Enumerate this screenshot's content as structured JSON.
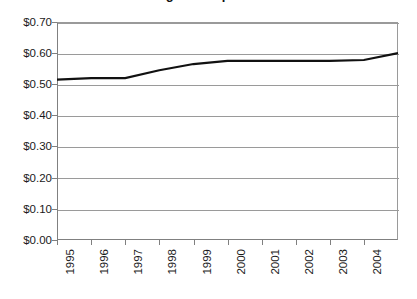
{
  "chart": {
    "title": "Average Price per Gallon",
    "title_note": "title is cropped off the top edge of the screenshot"
  },
  "axes": {
    "y_tick_labels": [
      "$0.70",
      "$0.60",
      "$0.50",
      "$0.40",
      "$0.30",
      "$0.20",
      "$0.10",
      "$0.00"
    ],
    "x_tick_labels": [
      "1995",
      "1996",
      "1997",
      "1998",
      "1999",
      "2000",
      "2001",
      "2002",
      "2003",
      "2004"
    ]
  },
  "colors": {
    "series_line": "#111111",
    "gridline": "#9a9a9a",
    "axis": "#808080",
    "background": "#ffffff",
    "text": "#1a1a1a"
  },
  "chart_data": {
    "type": "line",
    "title": "Average Price per Gallon",
    "subtitle": "",
    "xlabel": "",
    "ylabel": "",
    "categories": [
      "1995",
      "1996",
      "1997",
      "1998",
      "1999",
      "2000",
      "2001",
      "2002",
      "2003",
      "2004"
    ],
    "x": [
      1995,
      1996,
      1997,
      1998,
      1999,
      2000,
      2001,
      2002,
      2003,
      2004
    ],
    "values": [
      0.515,
      0.52,
      0.52,
      0.545,
      0.565,
      0.575,
      0.575,
      0.575,
      0.575,
      0.578
    ],
    "series": [
      {
        "name": "Price",
        "values": [
          0.515,
          0.52,
          0.52,
          0.545,
          0.565,
          0.575,
          0.575,
          0.575,
          0.575,
          0.578
        ]
      }
    ],
    "final_point_value": 0.6,
    "ylim": [
      0.0,
      0.7
    ],
    "ytick_step": 0.1,
    "ytick_values": [
      0.0,
      0.1,
      0.2,
      0.3,
      0.4,
      0.5,
      0.6,
      0.7
    ],
    "y_tick_labels": [
      "$0.00",
      "$0.10",
      "$0.20",
      "$0.30",
      "$0.40",
      "$0.50",
      "$0.60",
      "$0.70"
    ],
    "value_prefix": "$",
    "grid": true,
    "grid_axis": "y",
    "legend": false,
    "legend_position": "none",
    "markers": false,
    "line_width": 2
  }
}
